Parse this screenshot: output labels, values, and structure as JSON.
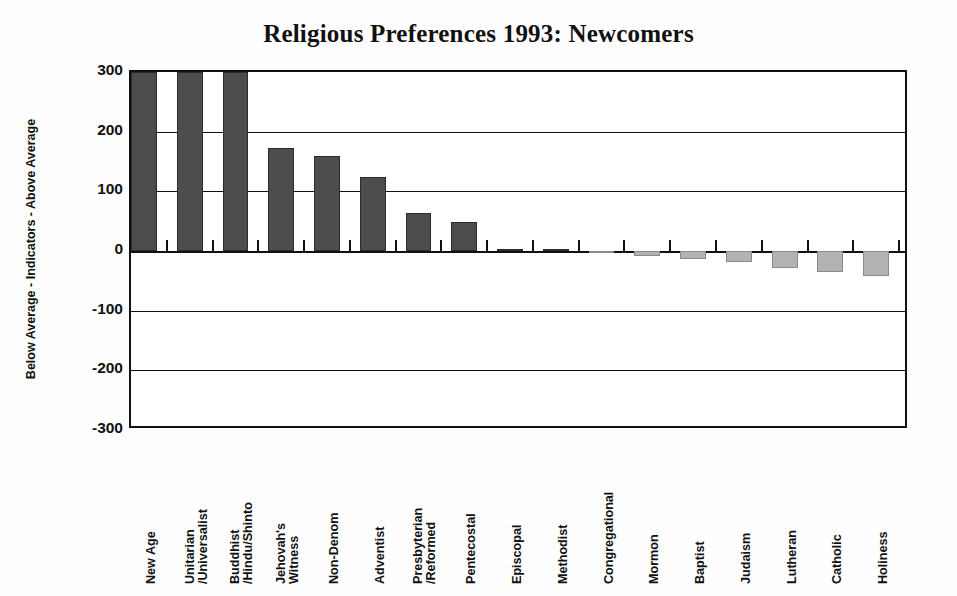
{
  "chart_data": {
    "type": "bar",
    "title": "Religious Preferences 1993: Newcomers",
    "xlabel": "",
    "ylabel": "Below Average - Indicators - Above Average",
    "ylim": [
      -300,
      300
    ],
    "yticks": [
      300,
      200,
      100,
      0,
      -100,
      -200,
      -300
    ],
    "ytick_labels": [
      "300",
      "200",
      "100",
      "0",
      "-100",
      "-200",
      "-300"
    ],
    "grid": true,
    "gridlines": [
      200,
      100,
      0,
      -100,
      -200
    ],
    "legend": "none",
    "note_clipped": "First three bars exceed the 300 axis maximum and are clipped at the top of the plot",
    "colors": {
      "positive_bar": "#4d4d4d",
      "negative_bar": "#b3b3b3",
      "axis": "#111111",
      "background": "#ffffff"
    },
    "categories": [
      "New Age",
      "Unitarian /Universalist",
      "Buddhist /Hindu/Shinto",
      "Jehovah's Witness",
      "Non-Denom",
      "Adventist",
      "Presbyterian /Reformed",
      "Pentecostal",
      "Episcopal",
      "Methodist",
      "Congregational",
      "Mormon",
      "Baptist",
      "Judaism",
      "Lutheran",
      "Catholic",
      "Holiness"
    ],
    "values": [
      300,
      300,
      300,
      173,
      160,
      124,
      64,
      49,
      4,
      4,
      -3,
      -8,
      -13,
      -18,
      -28,
      -35,
      -42
    ]
  },
  "categories_display": [
    {
      "lines": [
        "New Age"
      ]
    },
    {
      "lines": [
        "Unitarian",
        "/Universalist"
      ]
    },
    {
      "lines": [
        "Buddhist",
        "/Hindu/Shinto"
      ]
    },
    {
      "lines": [
        "Jehovah's",
        "Witness"
      ]
    },
    {
      "lines": [
        "Non-Denom"
      ]
    },
    {
      "lines": [
        "Adventist"
      ]
    },
    {
      "lines": [
        "Presbyterian",
        "/Reformed"
      ]
    },
    {
      "lines": [
        "Pentecostal"
      ]
    },
    {
      "lines": [
        "Episcopal"
      ]
    },
    {
      "lines": [
        "Methodist"
      ]
    },
    {
      "lines": [
        "Congregational"
      ]
    },
    {
      "lines": [
        "Mormon"
      ]
    },
    {
      "lines": [
        "Baptist"
      ]
    },
    {
      "lines": [
        "Judaism"
      ]
    },
    {
      "lines": [
        "Lutheran"
      ]
    },
    {
      "lines": [
        "Catholic"
      ]
    },
    {
      "lines": [
        "Holiness"
      ]
    }
  ]
}
